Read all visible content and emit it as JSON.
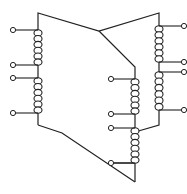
{
  "diagram": {
    "type": "three-phase transformer winding schematic",
    "stroke_color": "#222222",
    "background": "#ffffff",
    "windings": [
      {
        "name": "left-upper",
        "x": 38,
        "y1": 30,
        "y2": 65,
        "terminal_side": "left"
      },
      {
        "name": "left-lower",
        "x": 38,
        "y1": 78,
        "y2": 113,
        "terminal_side": "left"
      },
      {
        "name": "middle-upper",
        "x": 135,
        "y1": 79,
        "y2": 114,
        "terminal_side": "left"
      },
      {
        "name": "middle-lower",
        "x": 135,
        "y1": 128,
        "y2": 163,
        "terminal_side": "left"
      },
      {
        "name": "right-upper",
        "x": 159,
        "y1": 26,
        "y2": 62,
        "terminal_side": "right"
      },
      {
        "name": "right-lower",
        "x": 159,
        "y1": 72,
        "y2": 110,
        "terminal_side": "right"
      }
    ],
    "terminals": [
      {
        "x": 13,
        "y": 30
      },
      {
        "x": 13,
        "y": 65
      },
      {
        "x": 13,
        "y": 78
      },
      {
        "x": 13,
        "y": 113
      },
      {
        "x": 111,
        "y": 79
      },
      {
        "x": 111,
        "y": 114
      },
      {
        "x": 111,
        "y": 128
      },
      {
        "x": 111,
        "y": 163
      },
      {
        "x": 184,
        "y": 26
      },
      {
        "x": 184,
        "y": 62
      },
      {
        "x": 184,
        "y": 72
      },
      {
        "x": 184,
        "y": 110
      }
    ]
  }
}
